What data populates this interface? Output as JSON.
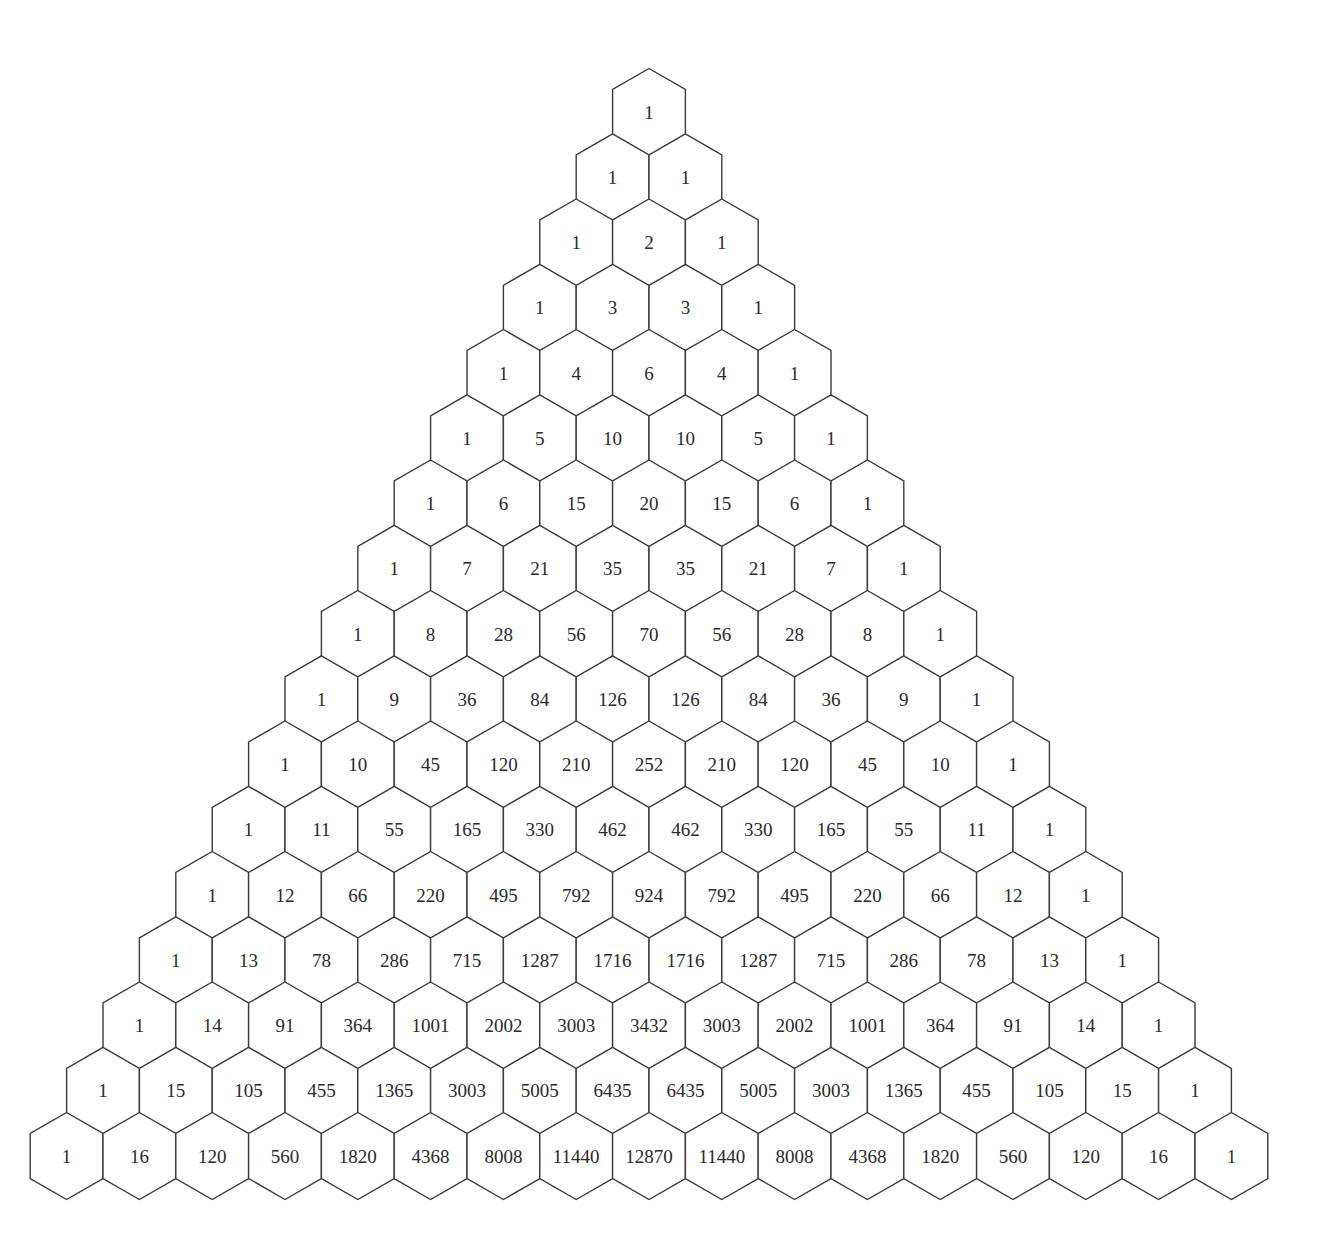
{
  "diagram": {
    "row_count": 17,
    "geometry": {
      "apex_center_x": 649,
      "row0_center_y": 112,
      "hex_width": 72.8,
      "slant_height": 21,
      "side_height": 45,
      "row_step": 65.25
    },
    "colors": {
      "stroke": "#3a3a3a",
      "fill": "#ffffff",
      "text": "#2a2a2a"
    },
    "rows": [
      [
        1
      ],
      [
        1,
        1
      ],
      [
        1,
        2,
        1
      ],
      [
        1,
        3,
        3,
        1
      ],
      [
        1,
        4,
        6,
        4,
        1
      ],
      [
        1,
        5,
        10,
        10,
        5,
        1
      ],
      [
        1,
        6,
        15,
        20,
        15,
        6,
        1
      ],
      [
        1,
        7,
        21,
        35,
        35,
        21,
        7,
        1
      ],
      [
        1,
        8,
        28,
        56,
        70,
        56,
        28,
        8,
        1
      ],
      [
        1,
        9,
        36,
        84,
        126,
        126,
        84,
        36,
        9,
        1
      ],
      [
        1,
        10,
        45,
        120,
        210,
        252,
        210,
        120,
        45,
        10,
        1
      ],
      [
        1,
        11,
        55,
        165,
        330,
        462,
        462,
        330,
        165,
        55,
        11,
        1
      ],
      [
        1,
        12,
        66,
        220,
        495,
        792,
        924,
        792,
        495,
        220,
        66,
        12,
        1
      ],
      [
        1,
        13,
        78,
        286,
        715,
        1287,
        1716,
        1716,
        1287,
        715,
        286,
        78,
        13,
        1
      ],
      [
        1,
        14,
        91,
        364,
        1001,
        2002,
        3003,
        3432,
        3003,
        2002,
        1001,
        364,
        91,
        14,
        1
      ],
      [
        1,
        15,
        105,
        455,
        1365,
        3003,
        5005,
        6435,
        6435,
        5005,
        3003,
        1365,
        455,
        105,
        15,
        1
      ],
      [
        1,
        16,
        120,
        560,
        1820,
        4368,
        8008,
        11440,
        12870,
        11440,
        8008,
        4368,
        1820,
        560,
        120,
        16,
        1
      ]
    ]
  }
}
